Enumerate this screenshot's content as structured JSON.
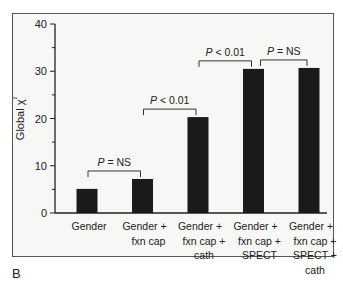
{
  "panel_label": "B",
  "chart_data": {
    "type": "bar",
    "title": "",
    "xlabel": "",
    "ylabel": "Global χ²",
    "ylim": [
      0,
      40
    ],
    "yticks": [
      0,
      10,
      20,
      30,
      40
    ],
    "grid": false,
    "categories": [
      [
        "Gender"
      ],
      [
        "Gender +",
        "fxn cap"
      ],
      [
        "Gender +",
        "fxn cap +",
        "cath"
      ],
      [
        "Gender +",
        "fxn cap +",
        "SPECT"
      ],
      [
        "Gender +",
        "fxn cap +",
        "SPECT +",
        "cath"
      ]
    ],
    "values": [
      5.1,
      7.2,
      20.3,
      30.5,
      30.7
    ],
    "bar_color": "#1a1a1a",
    "comparisons": [
      {
        "from": 0,
        "to": 1,
        "label_italic": "P",
        "label_rest": " = NS"
      },
      {
        "from": 1,
        "to": 2,
        "label_italic": "P",
        "label_rest": " < 0.01"
      },
      {
        "from": 2,
        "to": 3,
        "label_italic": "P",
        "label_rest": " < 0.01"
      },
      {
        "from": 3,
        "to": 4,
        "label_italic": "P",
        "label_rest": " = NS"
      }
    ]
  }
}
